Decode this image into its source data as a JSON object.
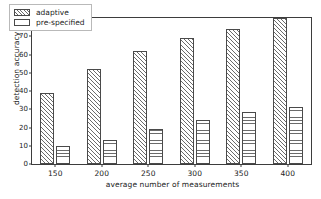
{
  "chart_data": {
    "type": "bar",
    "title": "",
    "xlabel": "average number of measurements",
    "ylabel": "detection accuracy (%)",
    "categories": [
      "150",
      "200",
      "250",
      "300",
      "350",
      "400"
    ],
    "series": [
      {
        "name": "adaptive",
        "values": [
          39,
          52,
          62,
          69,
          74,
          80
        ]
      },
      {
        "name": "pre-specified",
        "values": [
          10,
          13,
          19,
          24,
          28.5,
          31.5
        ]
      }
    ],
    "ylim": [
      0,
      80
    ],
    "yticks": [
      0,
      10,
      20,
      30,
      40,
      50,
      60,
      70,
      80
    ],
    "ytick_labels": [
      "0",
      "10",
      "20",
      "30",
      "40",
      "50",
      "60",
      "70",
      "80"
    ],
    "grid": false,
    "legend_position": "upper-left",
    "frame": true,
    "hatches": {
      "adaptive": "diagonal",
      "pre-specified": "horizontal"
    },
    "colors": {
      "line": "#3d3d3d",
      "hatch": "#6b6b6b",
      "fill": "#ffffff",
      "text": "#1a1a1a"
    }
  },
  "legend": {
    "entries": [
      {
        "label": "adaptive"
      },
      {
        "label": "pre-specified"
      }
    ]
  }
}
